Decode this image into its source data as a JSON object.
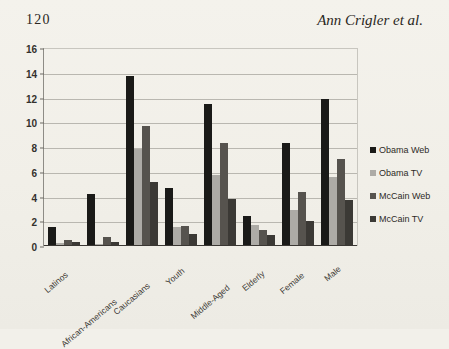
{
  "page": {
    "folio": "120",
    "running_title": "Ann Crigler et al.",
    "background_color": "#f2f0ea"
  },
  "chart_data": {
    "type": "bar",
    "title": "",
    "xlabel": "",
    "ylabel": "",
    "ylim": [
      0,
      16
    ],
    "yticks": [
      0,
      2,
      4,
      6,
      8,
      10,
      12,
      14,
      16
    ],
    "grid": true,
    "legend_position": "right",
    "categories": [
      "Latinos",
      "African-Americans",
      "Caucasians",
      "Youth",
      "Middle-Aged",
      "Elderly",
      "Female",
      "Male"
    ],
    "series": [
      {
        "name": "Obama Web",
        "color": "#1a1a18",
        "values": [
          1.5,
          4.2,
          13.7,
          4.7,
          11.5,
          2.4,
          8.3,
          11.9
        ]
      },
      {
        "name": "Obama TV",
        "color": "#adaba6",
        "values": [
          0.25,
          0.2,
          7.8,
          1.5,
          5.7,
          1.7,
          2.9,
          5.6
        ]
      },
      {
        "name": "McCain Web",
        "color": "#56534e",
        "values": [
          0.5,
          0.7,
          9.7,
          1.6,
          8.3,
          1.3,
          4.4,
          7.0
        ]
      },
      {
        "name": "McCain TV",
        "color": "#3b3935",
        "values": [
          0.3,
          0.35,
          5.2,
          1.0,
          3.8,
          0.9,
          2.0,
          3.7
        ]
      }
    ]
  }
}
